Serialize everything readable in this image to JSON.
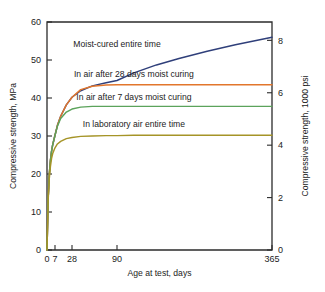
{
  "chart_data": {
    "type": "line",
    "title": "",
    "xlabel": "Age at test, days",
    "ylabel": "Compressive strength, MPa",
    "y2label": "Compressive strength, 1000 psi",
    "xticks": [
      "0",
      "7",
      "28",
      "90",
      "365"
    ],
    "xtick_values": [
      0,
      7,
      28,
      90,
      365
    ],
    "yticks": [
      "0",
      "10",
      "20",
      "30",
      "40",
      "50",
      "60"
    ],
    "ytick_values": [
      0,
      10,
      20,
      30,
      40,
      50,
      60
    ],
    "ylim": [
      0,
      60
    ],
    "y2ticks": [
      "0",
      "2",
      "4",
      "6",
      "8"
    ],
    "y2tick_values": [
      0,
      2,
      4,
      6,
      8
    ],
    "y2lim": [
      0,
      8.7
    ],
    "grid": false,
    "legend_position": "inline-annotations",
    "xscale": "compressed-age",
    "series": [
      {
        "name": "Moist-cured entire time",
        "color": "#2f3f7a",
        "label_x": 90,
        "label_y": 53.5,
        "x": [
          0,
          1,
          2,
          3,
          4,
          5,
          7,
          10,
          14,
          21,
          28,
          40,
          56,
          75,
          90,
          120,
          160,
          200,
          250,
          300,
          365
        ],
        "y": [
          0,
          13.5,
          20.0,
          23.6,
          26.0,
          27.7,
          30.2,
          32.8,
          35.2,
          38.2,
          40.2,
          41.9,
          43.2,
          44.0,
          44.6,
          46.6,
          48.7,
          50.4,
          52.3,
          54.0,
          56.0
        ]
      },
      {
        "name": "In air after 28 days moist curing",
        "color": "#e2762c",
        "label_x": 120,
        "label_y": 45.4,
        "x": [
          0,
          1,
          2,
          3,
          4,
          5,
          7,
          10,
          14,
          21,
          28,
          40,
          56,
          75,
          90,
          120,
          160,
          200,
          250,
          300,
          365
        ],
        "y": [
          0,
          13.5,
          20.0,
          23.6,
          26.0,
          27.7,
          30.2,
          32.8,
          35.2,
          38.2,
          40.2,
          42.2,
          43.1,
          43.4,
          43.5,
          43.5,
          43.5,
          43.5,
          43.5,
          43.5,
          43.5
        ]
      },
      {
        "name": "In air after 7 days moist curing",
        "color": "#5ba35b",
        "label_x": 120,
        "label_y": 39.6,
        "x": [
          0,
          1,
          2,
          3,
          4,
          5,
          7,
          10,
          14,
          21,
          28,
          40,
          56,
          75,
          90,
          120,
          160,
          200,
          250,
          300,
          365
        ],
        "y": [
          0,
          13.5,
          20.0,
          23.6,
          26.0,
          27.7,
          30.2,
          32.6,
          34.6,
          36.3,
          37.1,
          37.6,
          37.8,
          37.8,
          37.8,
          37.8,
          37.8,
          37.8,
          37.8,
          37.8,
          37.8
        ]
      },
      {
        "name": "In laboratory air entire time",
        "color": "#a59427",
        "label_x": 120,
        "label_y": 32.4,
        "x": [
          0,
          1,
          2,
          3,
          4,
          5,
          7,
          10,
          14,
          21,
          28,
          40,
          56,
          75,
          90,
          120,
          160,
          200,
          250,
          300,
          365
        ],
        "y": [
          0,
          13.0,
          18.8,
          22.0,
          24.1,
          25.4,
          26.9,
          27.9,
          28.6,
          29.3,
          29.6,
          29.9,
          30.0,
          30.1,
          30.1,
          30.2,
          30.2,
          30.2,
          30.2,
          30.2,
          30.2
        ]
      }
    ]
  },
  "colors": {
    "axis": "#2b2b2b",
    "text": "#1c1c1c",
    "background": "#ffffff"
  }
}
